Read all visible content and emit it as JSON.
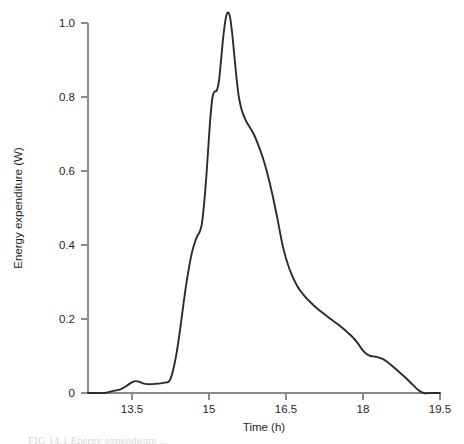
{
  "figure": {
    "background_color": "#ffffff",
    "curve_color": "#2b2b2b",
    "axis_color": "#8a8a8a",
    "caption_partial": "FIG 14.1  Energy expenditure ..."
  },
  "chart_data": {
    "type": "line",
    "title": "",
    "xlabel": "Time (h)",
    "ylabel": "Energy expenditure (W)",
    "xlim": [
      13.0,
      19.5
    ],
    "ylim": [
      0,
      1.05
    ],
    "xticks": [
      13.5,
      15,
      16.5,
      18,
      19.5
    ],
    "xtick_labels": [
      "13.5",
      "15",
      "16.5",
      "18",
      "19.5"
    ],
    "yticks": [
      0,
      0.2,
      0.4,
      0.6,
      0.8,
      1.0
    ],
    "ytick_labels": [
      "0",
      "0.2",
      "0.4",
      "0.6",
      "0.8",
      "1.0"
    ],
    "grid": false,
    "legend": null,
    "series": [
      {
        "name": "Energy expenditure",
        "x": [
          13.0,
          13.15,
          13.3,
          13.45,
          13.6,
          13.7,
          13.8,
          13.88,
          13.95,
          14.02,
          14.1,
          14.18,
          14.26,
          14.34,
          14.42,
          14.5,
          14.56,
          14.62,
          14.68,
          14.74,
          14.8,
          14.86,
          14.92,
          14.98,
          15.02,
          15.06,
          15.1,
          15.14,
          15.18,
          15.22,
          15.26,
          15.3,
          15.34,
          15.38,
          15.42,
          15.46,
          15.5,
          15.54,
          15.58,
          15.62,
          15.66,
          15.7,
          15.74,
          15.78,
          15.82,
          15.86,
          15.92,
          15.98,
          16.06,
          16.14,
          16.22,
          16.3,
          16.4,
          16.5,
          16.6,
          16.72,
          16.86,
          17.0,
          17.16,
          17.32,
          17.48,
          17.62,
          17.76,
          17.88,
          17.98,
          18.06,
          18.14,
          18.22,
          18.32,
          18.44,
          18.58,
          18.72,
          18.86,
          19.0,
          19.1,
          19.2,
          19.35,
          19.5
        ],
        "y": [
          0.0,
          0.0,
          0.0,
          0.005,
          0.01,
          0.018,
          0.028,
          0.032,
          0.03,
          0.026,
          0.024,
          0.024,
          0.025,
          0.026,
          0.028,
          0.032,
          0.055,
          0.095,
          0.15,
          0.215,
          0.28,
          0.335,
          0.38,
          0.41,
          0.425,
          0.435,
          0.455,
          0.505,
          0.575,
          0.66,
          0.745,
          0.8,
          0.815,
          0.818,
          0.845,
          0.905,
          0.965,
          1.01,
          1.028,
          1.018,
          0.975,
          0.915,
          0.855,
          0.805,
          0.775,
          0.755,
          0.735,
          0.72,
          0.7,
          0.672,
          0.64,
          0.6,
          0.54,
          0.47,
          0.395,
          0.335,
          0.29,
          0.262,
          0.238,
          0.218,
          0.2,
          0.185,
          0.168,
          0.152,
          0.135,
          0.118,
          0.106,
          0.1,
          0.098,
          0.092,
          0.078,
          0.06,
          0.042,
          0.022,
          0.008,
          0.0,
          0.0,
          0.0
        ]
      }
    ]
  }
}
